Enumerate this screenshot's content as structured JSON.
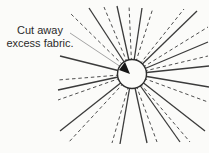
{
  "figure": {
    "description_label": {
      "line1": "Cut away",
      "line2": "excess fabric."
    },
    "colors": {
      "background": "#fbfbf9",
      "solid_line": "#3b3b3b",
      "dashed_line": "#4f4f4f",
      "circle_fill": "#fbfbf9",
      "circle_stroke": "#2e2e2e",
      "leader": "#9a9a9a",
      "arrow": "#161616",
      "text": "#2b2b2b"
    },
    "canvas": {
      "width": 209,
      "height": 153
    },
    "center": {
      "x": 132,
      "y": 74
    },
    "circle_radius": 14.5,
    "solid_line_endpoints": [
      [
        60,
        56
      ],
      [
        89,
        8
      ],
      [
        117,
        6
      ],
      [
        142,
        8
      ],
      [
        197,
        11
      ],
      [
        208,
        42
      ],
      [
        209,
        66
      ],
      [
        209,
        87
      ],
      [
        205,
        131
      ],
      [
        180,
        142
      ],
      [
        147,
        143
      ],
      [
        120,
        144
      ],
      [
        60,
        131
      ],
      [
        58,
        90
      ]
    ],
    "dashed_line_endpoints": [
      [
        70,
        13
      ],
      [
        104,
        7
      ],
      [
        129,
        5
      ],
      [
        153,
        8
      ],
      [
        184,
        9
      ],
      [
        208,
        27
      ],
      [
        208,
        56
      ],
      [
        208,
        102
      ],
      [
        190,
        142
      ],
      [
        157,
        142
      ],
      [
        112,
        143
      ],
      [
        68,
        143
      ],
      [
        58,
        100
      ],
      [
        58,
        80
      ]
    ],
    "solid_stroke_width": 1.3,
    "dashed_stroke_width": 1,
    "dash_pattern": "3.5,2.8",
    "leader": {
      "x1": 70,
      "y1": 33,
      "x2": 124,
      "y2": 69
    },
    "arrow_points": "130,74 119,70 125,62"
  }
}
